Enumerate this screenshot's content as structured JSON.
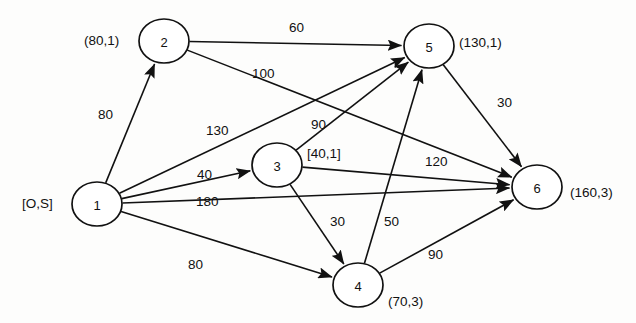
{
  "diagram": {
    "type": "node-link-diagram",
    "width": 636,
    "height": 323,
    "stroke_color": "#111111",
    "node_fill": "#ffffff",
    "background": "#fdfdfc"
  },
  "nodes": [
    {
      "id": "1",
      "label": "1",
      "cx": 97,
      "cy": 204,
      "rx": 25,
      "ry": 22,
      "annotation": "[O,S]",
      "ann_x": 22,
      "ann_y": 197,
      "ann_anchor": "left"
    },
    {
      "id": "2",
      "label": "2",
      "cx": 164,
      "cy": 41,
      "rx": 25,
      "ry": 22,
      "annotation": "(80,1)",
      "ann_x": 84,
      "ann_y": 34,
      "ann_anchor": "left"
    },
    {
      "id": "3",
      "label": "3",
      "cx": 277,
      "cy": 165,
      "rx": 25,
      "ry": 22,
      "annotation": "[40,1]",
      "ann_x": 307,
      "ann_y": 147,
      "ann_anchor": "left"
    },
    {
      "id": "4",
      "label": "4",
      "cx": 358,
      "cy": 285,
      "rx": 25,
      "ry": 22,
      "annotation": "(70,3)",
      "ann_x": 388,
      "ann_y": 295,
      "ann_anchor": "left"
    },
    {
      "id": "5",
      "label": "5",
      "cx": 429,
      "cy": 46,
      "rx": 25,
      "ry": 22,
      "annotation": "(130,1)",
      "ann_x": 459,
      "ann_y": 36,
      "ann_anchor": "left"
    },
    {
      "id": "6",
      "label": "6",
      "cx": 537,
      "cy": 187,
      "rx": 25,
      "ry": 22,
      "annotation": "(160,3)",
      "ann_x": 570,
      "ann_y": 186,
      "ann_anchor": "left"
    }
  ],
  "edges": [
    {
      "from": "1",
      "to": "2",
      "weight": "80",
      "lx": 98,
      "ly": 108,
      "x1": 97,
      "y1": 204,
      "x2": 164,
      "y2": 41
    },
    {
      "from": "2",
      "to": "5",
      "weight": "60",
      "lx": 289,
      "ly": 21,
      "x1": 164,
      "y1": 41,
      "x2": 429,
      "y2": 46
    },
    {
      "from": "2",
      "to": "6",
      "weight": "100",
      "lx": 252,
      "ly": 67,
      "x1": 164,
      "y1": 41,
      "x2": 537,
      "y2": 187
    },
    {
      "from": "1",
      "to": "5",
      "weight": "130",
      "lx": 206,
      "ly": 124,
      "x1": 97,
      "y1": 204,
      "x2": 429,
      "y2": 46
    },
    {
      "from": "3",
      "to": "5",
      "weight": "90",
      "lx": 311,
      "ly": 118,
      "x1": 277,
      "y1": 165,
      "x2": 429,
      "y2": 46
    },
    {
      "from": "1",
      "to": "3",
      "weight": "40",
      "lx": 197,
      "ly": 168,
      "x1": 97,
      "y1": 204,
      "x2": 277,
      "y2": 165
    },
    {
      "from": "3",
      "to": "6",
      "weight": "120",
      "lx": 425,
      "ly": 155,
      "x1": 277,
      "y1": 165,
      "x2": 537,
      "y2": 187
    },
    {
      "from": "1",
      "to": "6",
      "weight": "180",
      "lx": 196,
      "ly": 195,
      "x1": 97,
      "y1": 204,
      "x2": 537,
      "y2": 187
    },
    {
      "from": "3",
      "to": "4",
      "weight": "30",
      "lx": 330,
      "ly": 215,
      "x1": 277,
      "y1": 165,
      "x2": 358,
      "y2": 285
    },
    {
      "from": "4",
      "to": "5",
      "weight": "50",
      "lx": 384,
      "ly": 215,
      "x1": 358,
      "y1": 285,
      "x2": 429,
      "y2": 46
    },
    {
      "from": "5",
      "to": "6",
      "weight": "30",
      "lx": 497,
      "ly": 96,
      "x1": 429,
      "y1": 46,
      "x2": 537,
      "y2": 187
    },
    {
      "from": "1",
      "to": "4",
      "weight": "80",
      "lx": 188,
      "ly": 258,
      "x1": 97,
      "y1": 204,
      "x2": 358,
      "y2": 285
    },
    {
      "from": "4",
      "to": "6",
      "weight": "90",
      "lx": 428,
      "ly": 248,
      "x1": 358,
      "y1": 285,
      "x2": 537,
      "y2": 187
    }
  ]
}
